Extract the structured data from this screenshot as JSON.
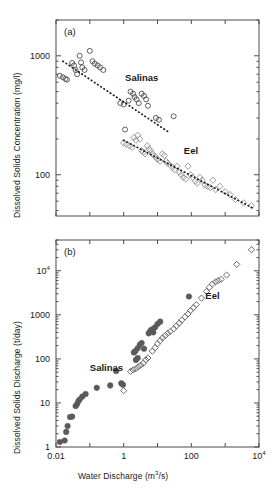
{
  "figure": {
    "background": "#ffffff",
    "foreground": "#1a1a1a",
    "axis_color": "#4d4d4d"
  },
  "chart_data": [
    {
      "type": "scatter",
      "panel_label": "(a)",
      "title": "",
      "xlabel": "",
      "ylabel": "Dissolved Solids Concentration (mg/l)",
      "xscale": "log",
      "yscale": "log",
      "xlim": [
        0.01,
        10000
      ],
      "ylim": [
        45,
        2000
      ],
      "grid": false,
      "xticklabels": [],
      "yticklabels": [
        "1000",
        "100"
      ],
      "ytickvalues": [
        1000,
        100
      ],
      "legend_position": "inline-annotation",
      "annotations": [
        {
          "text": "Salinas",
          "x": 1.1,
          "y": 620
        },
        {
          "text": "Eel",
          "x": 60,
          "y": 150
        }
      ],
      "series": [
        {
          "name": "Salinas",
          "marker": "open-circle",
          "color": "#4d4d4d",
          "points": [
            [
              0.013,
              680
            ],
            [
              0.016,
              660
            ],
            [
              0.019,
              640
            ],
            [
              0.021,
              630
            ],
            [
              0.03,
              870
            ],
            [
              0.034,
              830
            ],
            [
              0.038,
              760
            ],
            [
              0.042,
              700
            ],
            [
              0.05,
              1000
            ],
            [
              0.055,
              880
            ],
            [
              0.06,
              800
            ],
            [
              0.07,
              760
            ],
            [
              0.1,
              1100
            ],
            [
              0.12,
              900
            ],
            [
              0.14,
              860
            ],
            [
              0.17,
              830
            ],
            [
              0.2,
              800
            ],
            [
              0.25,
              760
            ],
            [
              0.8,
              400
            ],
            [
              1.0,
              390
            ],
            [
              1.4,
              420
            ],
            [
              1.6,
              500
            ],
            [
              1.9,
              480
            ],
            [
              2.1,
              450
            ],
            [
              2.4,
              430
            ],
            [
              2.8,
              400
            ],
            [
              3.4,
              480
            ],
            [
              4.0,
              460
            ],
            [
              4.6,
              430
            ],
            [
              5.2,
              380
            ],
            [
              9.0,
              300
            ],
            [
              11,
              290
            ],
            [
              30,
              310
            ],
            [
              1.1,
              240
            ]
          ]
        },
        {
          "name": "Salinas-trend",
          "marker": "dotted-line",
          "color": "#1a1a1a",
          "points": [
            [
              0.016,
              900
            ],
            [
              23,
              225
            ]
          ]
        },
        {
          "name": "Eel",
          "marker": "open-diamond",
          "color": "#9a9a9a",
          "points": [
            [
              1.0,
              185
            ],
            [
              1.2,
              180
            ],
            [
              1.5,
              175
            ],
            [
              1.8,
              170
            ],
            [
              2.0,
              205
            ],
            [
              2.3,
              195
            ],
            [
              2.6,
              215
            ],
            [
              3.0,
              200
            ],
            [
              3.4,
              160
            ],
            [
              3.8,
              155
            ],
            [
              4.3,
              150
            ],
            [
              5.0,
              175
            ],
            [
              5.6,
              165
            ],
            [
              6.3,
              160
            ],
            [
              7.0,
              150
            ],
            [
              8.0,
              145
            ],
            [
              9.0,
              140
            ],
            [
              10,
              135
            ],
            [
              12,
              130
            ],
            [
              14,
              150
            ],
            [
              16,
              145
            ],
            [
              18,
              130
            ],
            [
              20,
              125
            ],
            [
              24,
              120
            ],
            [
              28,
              115
            ],
            [
              32,
              110
            ],
            [
              38,
              118
            ],
            [
              44,
              105
            ],
            [
              50,
              100
            ],
            [
              58,
              95
            ],
            [
              68,
              92
            ],
            [
              80,
              118
            ],
            [
              95,
              100
            ],
            [
              110,
              95
            ],
            [
              130,
              88
            ],
            [
              150,
              85
            ],
            [
              180,
              95
            ],
            [
              210,
              90
            ],
            [
              250,
              82
            ],
            [
              300,
              80
            ],
            [
              360,
              78
            ],
            [
              430,
              90
            ],
            [
              520,
              75
            ],
            [
              700,
              80
            ],
            [
              1000,
              72
            ],
            [
              1400,
              68
            ],
            [
              2000,
              62
            ],
            [
              3500,
              58
            ],
            [
              6000,
              55
            ]
          ]
        },
        {
          "name": "Eel-trend",
          "marker": "dotted-line",
          "color": "#1a1a1a",
          "points": [
            [
              1.0,
              195
            ],
            [
              7000,
              52
            ]
          ]
        }
      ]
    },
    {
      "type": "scatter",
      "panel_label": "(b)",
      "title": "",
      "xlabel": "Water Discharge (m3/s)",
      "ylabel": "Dissolved Solids Discharge (t/day)",
      "xscale": "log",
      "yscale": "log",
      "xlim": [
        0.01,
        10000
      ],
      "ylim": [
        1,
        50000
      ],
      "grid": false,
      "xticklabels": [
        "0.01",
        "1",
        "100",
        "104"
      ],
      "xtickvalues": [
        0.01,
        1,
        100,
        10000
      ],
      "yticklabels": [
        "1",
        "10",
        "100",
        "1000",
        "104"
      ],
      "ytickvalues": [
        1,
        10,
        100,
        1000,
        10000
      ],
      "legend_position": "inline-annotation",
      "annotations": [
        {
          "text": "Salinas",
          "x": 0.1,
          "y": 52
        },
        {
          "text": "Eel",
          "x": 260,
          "y": 2300
        }
      ],
      "series": [
        {
          "name": "Salinas",
          "marker": "filled-circle",
          "color": "#5a5a5a",
          "points": [
            [
              0.013,
              1.3
            ],
            [
              0.018,
              1.4
            ],
            [
              0.02,
              2.2
            ],
            [
              0.022,
              3.0
            ],
            [
              0.026,
              4.8
            ],
            [
              0.03,
              4.9
            ],
            [
              0.038,
              8.5
            ],
            [
              0.042,
              9.5
            ],
            [
              0.046,
              11
            ],
            [
              0.05,
              12
            ],
            [
              0.06,
              14
            ],
            [
              0.075,
              16
            ],
            [
              0.16,
              22
            ],
            [
              0.4,
              25
            ],
            [
              0.85,
              28
            ],
            [
              0.95,
              26
            ],
            [
              0.6,
              53
            ],
            [
              2.0,
              140
            ],
            [
              2.2,
              150
            ],
            [
              2.6,
              175
            ],
            [
              3.0,
              210
            ],
            [
              3.4,
              230
            ],
            [
              4.0,
              170
            ],
            [
              2.3,
              95
            ],
            [
              2.6,
              105
            ],
            [
              5.5,
              380
            ],
            [
              6.0,
              420
            ],
            [
              6.5,
              450
            ],
            [
              7.0,
              470
            ],
            [
              7.5,
              400
            ],
            [
              8.5,
              520
            ],
            [
              10,
              620
            ],
            [
              12,
              700
            ],
            [
              85,
              2600
            ]
          ]
        },
        {
          "name": "Eel",
          "marker": "open-diamond",
          "color": "#6a6a6a",
          "points": [
            [
              1.0,
              19
            ],
            [
              1.6,
              52
            ],
            [
              1.9,
              56
            ],
            [
              2.3,
              60
            ],
            [
              2.7,
              66
            ],
            [
              3.2,
              72
            ],
            [
              3.8,
              80
            ],
            [
              4.5,
              95
            ],
            [
              5.2,
              105
            ],
            [
              7.0,
              150
            ],
            [
              8.5,
              180
            ],
            [
              10,
              220
            ],
            [
              12,
              260
            ],
            [
              14,
              300
            ],
            [
              17,
              340
            ],
            [
              20,
              380
            ],
            [
              24,
              420
            ],
            [
              30,
              480
            ],
            [
              36,
              560
            ],
            [
              44,
              650
            ],
            [
              52,
              760
            ],
            [
              65,
              900
            ],
            [
              80,
              1050
            ],
            [
              95,
              1250
            ],
            [
              115,
              1450
            ],
            [
              140,
              1700
            ],
            [
              200,
              2400
            ],
            [
              280,
              3400
            ],
            [
              340,
              4200
            ],
            [
              420,
              5000
            ],
            [
              520,
              5600
            ],
            [
              620,
              6000
            ],
            [
              760,
              6400
            ],
            [
              1100,
              8000
            ],
            [
              2200,
              14000
            ],
            [
              6000,
              30000
            ]
          ]
        }
      ]
    }
  ]
}
